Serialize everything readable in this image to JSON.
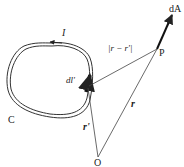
{
  "diagram": {
    "labels": {
      "current": "I",
      "curve": "C",
      "element": "dl'",
      "point": "P",
      "origin": "O",
      "area": "dA",
      "r": "r",
      "r_prime": "r'",
      "distance": "|r − r'|"
    },
    "colors": {
      "line": "#333333",
      "background": "#ffffff"
    }
  }
}
